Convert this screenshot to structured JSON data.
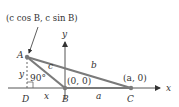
{
  "figure": {
    "type": "diagram",
    "colors": {
      "triangle": "#7a7a7a",
      "axes": "#555555",
      "text": "#333333",
      "dashed_altitude": "#666666"
    },
    "axes": {
      "x_label": "x",
      "y_label": "y"
    },
    "points": {
      "A": {
        "label": "A",
        "coord_label": "(c cos B, c sin B)"
      },
      "B": {
        "label": "B",
        "coord_label": "(0, 0)"
      },
      "C": {
        "label": "C",
        "coord_label": "(a, 0)"
      },
      "D": {
        "label": "D"
      }
    },
    "sides": {
      "a": "a",
      "b": "b",
      "c": "c",
      "x": "x",
      "y": "y"
    },
    "angle_label": "90°"
  }
}
